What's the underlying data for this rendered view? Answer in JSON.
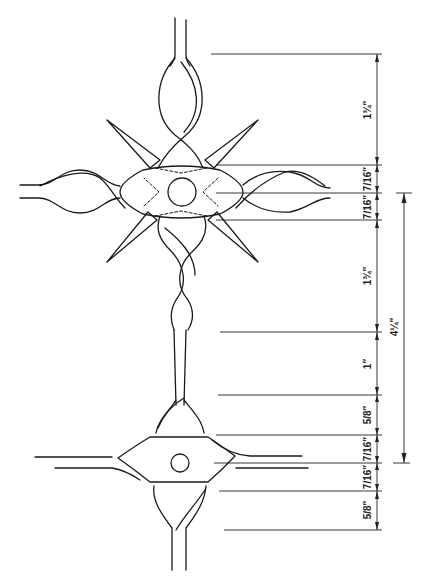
{
  "drawing": {
    "title": "Twisted bar cross ornament — dimensioned drawing",
    "ink_color": "#1a1a1a",
    "background": "#ffffff"
  },
  "dimensions": {
    "segments": [
      {
        "label": "1¾″",
        "from_y": 54,
        "to_y": 165
      },
      {
        "label": "7/16″",
        "from_y": 165,
        "to_y": 193
      },
      {
        "label": "7/16″",
        "from_y": 193,
        "to_y": 220
      },
      {
        "label": "1¾″",
        "from_y": 220,
        "to_y": 332
      },
      {
        "label": "1″",
        "from_y": 332,
        "to_y": 395
      },
      {
        "label": "5/8″",
        "from_y": 395,
        "to_y": 435
      },
      {
        "label": "7/16″",
        "from_y": 435,
        "to_y": 463
      },
      {
        "label": "7/16″",
        "from_y": 463,
        "to_y": 491
      },
      {
        "label": "5/8″",
        "from_y": 491,
        "to_y": 530
      }
    ],
    "overall": {
      "label": "4¼″",
      "from_y": 193,
      "to_y": 463
    }
  }
}
